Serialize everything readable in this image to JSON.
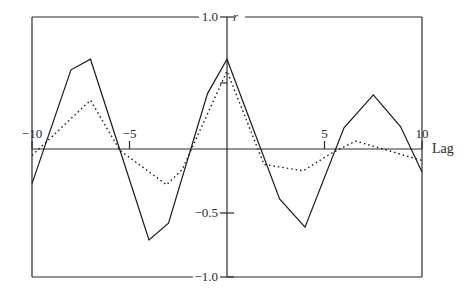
{
  "chart_data": {
    "type": "line",
    "title": "",
    "xlabel": "Lag",
    "ylabel": "r",
    "xlim": [
      -10,
      10
    ],
    "ylim": [
      -1.0,
      1.0
    ],
    "x_ticks": [
      {
        "value": -10,
        "label": "−10"
      },
      {
        "value": -5,
        "label": "−5"
      },
      {
        "value": 5,
        "label": "5"
      },
      {
        "value": 10,
        "label": "10"
      }
    ],
    "y_ticks": [
      {
        "value": 1.0,
        "label": "1.0"
      },
      {
        "value": 0.5,
        "label": ""
      },
      {
        "value": -0.5,
        "label": "−0.5"
      },
      {
        "value": -1.0,
        "label": "−1.0"
      }
    ],
    "grid": false,
    "legend": null,
    "series": [
      {
        "name": "solid",
        "style": "solid",
        "color": "#1a1a1a",
        "points": [
          [
            -10,
            -0.27
          ],
          [
            -8,
            0.6
          ],
          [
            -7,
            0.68
          ],
          [
            -4,
            -0.71
          ],
          [
            -3,
            -0.58
          ],
          [
            -1,
            0.42
          ],
          [
            0,
            0.68
          ],
          [
            2.7,
            -0.39
          ],
          [
            4,
            -0.61
          ],
          [
            6,
            0.16
          ],
          [
            7.5,
            0.41
          ],
          [
            8.9,
            0.17
          ],
          [
            10,
            -0.18
          ]
        ]
      },
      {
        "name": "dotted",
        "style": "dotted",
        "color": "#1a1a1a",
        "points": [
          [
            -10,
            -0.05
          ],
          [
            -7,
            0.37
          ],
          [
            -5.5,
            -0.01
          ],
          [
            -3.1,
            -0.28
          ],
          [
            -2.3,
            -0.16
          ],
          [
            0,
            0.59
          ],
          [
            1.9,
            -0.12
          ],
          [
            3.9,
            -0.17
          ],
          [
            5.4,
            -0.03
          ],
          [
            6.6,
            0.06
          ],
          [
            8,
            0.0
          ],
          [
            10,
            -0.09
          ]
        ]
      }
    ]
  },
  "labels": {
    "y_axis_name": "r",
    "x_axis_name": "Lag"
  }
}
